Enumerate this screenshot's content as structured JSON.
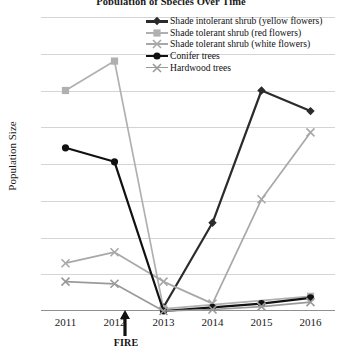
{
  "chart_data": {
    "type": "line",
    "title": "Population of Species Over Time",
    "xlabel": "",
    "ylabel": "Population Size",
    "categories": [
      "2011",
      "2012",
      "2013",
      "2014",
      "2015",
      "2016"
    ],
    "ylim": [
      0,
      400
    ],
    "ytick_values": [
      0,
      50,
      100,
      150,
      200,
      250,
      300,
      350,
      400
    ],
    "ytick_labels": [
      "0",
      "50",
      "100",
      "150",
      "200",
      "250",
      "300",
      "350",
      "400"
    ],
    "grid": true,
    "legend_position": "top-right",
    "annotations": [
      {
        "label": "FIRE",
        "x": "between 2012 and 2013",
        "type": "up-arrow"
      }
    ],
    "series": [
      {
        "name": "Shade intolerant shrub (yellow flowers)",
        "color": "#2b2b2b",
        "marker": "diamond",
        "values": [
          null,
          null,
          5,
          120,
          300,
          272
        ]
      },
      {
        "name": "Shade tolerant shrub (red flowers)",
        "color": "#b0b0b0",
        "marker": "square",
        "values": [
          300,
          340,
          3,
          null,
          null,
          20
        ]
      },
      {
        "name": "Shade tolerant shrub (white flowers)",
        "color": "#a8a8a8",
        "marker": "cross",
        "values": [
          65,
          80,
          40,
          10,
          152,
          243
        ]
      },
      {
        "name": "Conifer trees",
        "color": "#111111",
        "marker": "circle",
        "values": [
          222,
          203,
          0,
          5,
          10,
          18
        ]
      },
      {
        "name": "Hardwood trees",
        "color": "#9a9a9a",
        "marker": "cross",
        "values": [
          40,
          37,
          0,
          2,
          6,
          12
        ]
      }
    ]
  },
  "legend": {
    "items": [
      {
        "label": "Shade intolerant shrub (yellow flowers)"
      },
      {
        "label": "Shade tolerant shrub (red flowers)"
      },
      {
        "label": "Shade tolerant shrub (white flowers)"
      },
      {
        "label": "Conifer trees"
      },
      {
        "label": "Hardwood trees"
      }
    ]
  },
  "annotation": {
    "fire_label": "FIRE"
  }
}
